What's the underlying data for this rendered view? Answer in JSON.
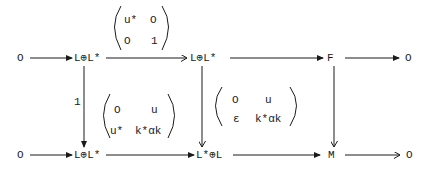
{
  "diagram": {
    "type": "commutative-diagram",
    "top_row": {
      "n0": "O",
      "n1": "L⊕L*",
      "n2": "L⊕L*",
      "n3": "F",
      "n4": "O"
    },
    "bottom_row": {
      "n0": "O",
      "n1": "L⊕L*",
      "n2": "L*⊕L",
      "n3": "M",
      "n4": "O"
    },
    "labels": {
      "left_vertical": "1",
      "top_matrix": {
        "a11": "u*",
        "a12": "O",
        "a21": "O",
        "a22": "1"
      },
      "bottom_matrix": {
        "a11": "O",
        "a12": "u",
        "a21": "u*",
        "a22": "k*αk"
      },
      "middle_matrix": {
        "a11": "O",
        "a12": "u",
        "a21": "ε",
        "a22": "k*αk"
      }
    },
    "colors": {
      "ink": "#1a1a1a",
      "background": "#ffffff"
    }
  }
}
